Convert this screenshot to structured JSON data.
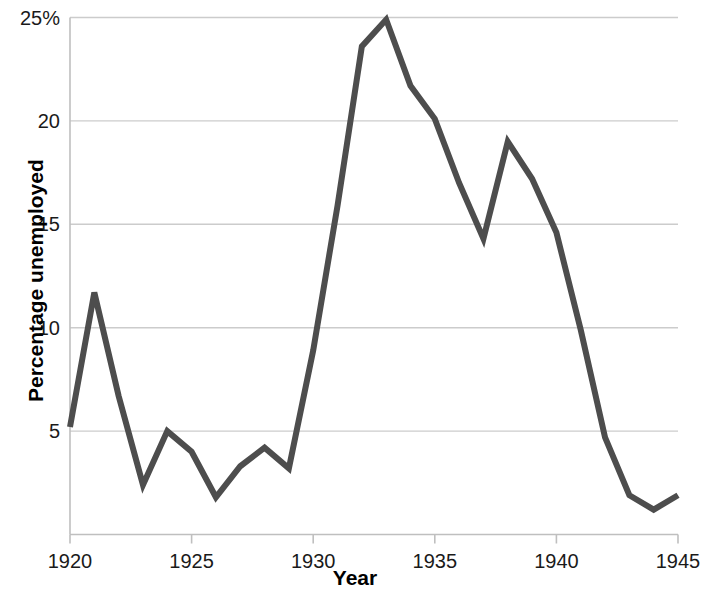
{
  "chart_data": {
    "type": "line",
    "title": "",
    "xlabel": "Year",
    "ylabel": "Percentage unemployed",
    "x": [
      1920,
      1921,
      1922,
      1923,
      1924,
      1925,
      1926,
      1927,
      1928,
      1929,
      1930,
      1931,
      1932,
      1933,
      1934,
      1935,
      1936,
      1937,
      1938,
      1939,
      1940,
      1941,
      1942,
      1943,
      1944,
      1945
    ],
    "values": [
      5.2,
      11.7,
      6.7,
      2.4,
      5.0,
      4.0,
      1.8,
      3.3,
      4.2,
      3.2,
      8.9,
      15.9,
      23.6,
      24.9,
      21.7,
      20.1,
      17.0,
      14.3,
      19.0,
      17.2,
      14.6,
      9.9,
      4.7,
      1.9,
      1.2,
      1.9
    ],
    "series": [
      {
        "name": "Percentage unemployed",
        "color": "#4d4d4d",
        "values": [
          5.2,
          11.7,
          6.7,
          2.4,
          5.0,
          4.0,
          1.8,
          3.3,
          4.2,
          3.2,
          8.9,
          15.9,
          23.6,
          24.9,
          21.7,
          20.1,
          17.0,
          14.3,
          19.0,
          17.2,
          14.6,
          9.9,
          4.7,
          1.9,
          1.2,
          1.9
        ]
      }
    ],
    "xlim": [
      1920,
      1945
    ],
    "ylim": [
      0,
      25
    ],
    "xticks": [
      1920,
      1925,
      1930,
      1935,
      1940,
      1945
    ],
    "xtick_labels": [
      "1920",
      "1925",
      "1930",
      "1935",
      "1940",
      "1945"
    ],
    "yticks": [
      5,
      10,
      15,
      20,
      25
    ],
    "ytick_labels": [
      "5",
      "10",
      "15",
      "20",
      "25%"
    ],
    "grid": "horizontal",
    "grid_color": "#cccccc",
    "legend": "none",
    "line_width_px": 6,
    "axis_color": "#bfbfbf",
    "text_color": "#1a1a1a"
  }
}
